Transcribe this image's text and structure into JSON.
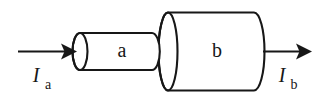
{
  "figure": {
    "kind": "technical-line-diagram",
    "background_color": "#ffffff",
    "line_color": "#171717",
    "parts": [
      {
        "id": "inner-cylinder",
        "label": "a",
        "label_x": 122,
        "label_y": 57,
        "role": "narrow-cylinder"
      },
      {
        "id": "outer-cylinder",
        "label": "b",
        "label_x": 217,
        "label_y": 57,
        "role": "wide-cylinder"
      }
    ],
    "currents": [
      {
        "id": "input-current",
        "symbol": "I",
        "subscript": "a",
        "symbol_x": 36,
        "symbol_y": 82,
        "sub_x": 48,
        "sub_y": 89,
        "direction": "rightward-into-cylinder-a"
      },
      {
        "id": "output-current",
        "symbol": "I",
        "subscript": "b",
        "symbol_x": 282,
        "symbol_y": 82,
        "sub_x": 294,
        "sub_y": 89,
        "direction": "rightward-out-of-cylinder-b"
      }
    ],
    "geometry": {
      "inner_cylinder": {
        "left_cap_cx": 80,
        "left_cap_cy": 51.5,
        "cap_rx": 7.5,
        "cap_ry": 18.5,
        "right_cap_cx": 152,
        "body_top_y": 33,
        "body_bottom_y": 70
      },
      "outer_cylinder": {
        "left_cap_cx": 168,
        "left_cap_cy": 51.5,
        "cap_rx": 9.5,
        "cap_ry": 39,
        "right_cap_cx": 254,
        "right_cap_rx": 10.5,
        "body_top_y": 12.5,
        "body_bottom_y": 90.5
      },
      "left_arrow": {
        "x_start": 18,
        "x_tip": 76,
        "y": 51.5
      },
      "right_arrow": {
        "x_start": 263,
        "x_tip": 311,
        "y": 51.5
      }
    }
  }
}
